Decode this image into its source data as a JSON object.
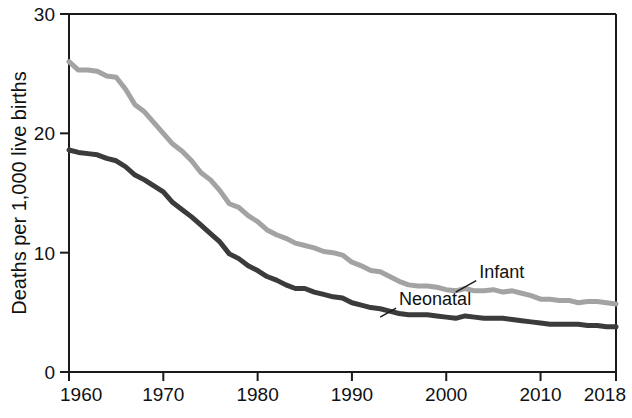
{
  "chart_data": {
    "type": "line",
    "title": "",
    "xlabel": "",
    "ylabel": "Deaths per 1,000 live births",
    "xlim": [
      1960,
      2018
    ],
    "ylim": [
      0,
      30
    ],
    "grid": false,
    "legend_position": "inline-annotations",
    "x_tick_labels": [
      "1960",
      "1970",
      "1980",
      "1990",
      "2000",
      "2010",
      "2018"
    ],
    "x_ticks": [
      1960,
      1970,
      1980,
      1990,
      2000,
      2010,
      2018
    ],
    "y_tick_labels": [
      "0",
      "10",
      "20",
      "30"
    ],
    "y_ticks": [
      0,
      10,
      20,
      30
    ],
    "x": [
      1960,
      1961,
      1962,
      1963,
      1964,
      1965,
      1966,
      1967,
      1968,
      1969,
      1970,
      1971,
      1972,
      1973,
      1974,
      1975,
      1976,
      1977,
      1978,
      1979,
      1980,
      1981,
      1982,
      1983,
      1984,
      1985,
      1986,
      1987,
      1988,
      1989,
      1990,
      1991,
      1992,
      1993,
      1994,
      1995,
      1996,
      1997,
      1998,
      1999,
      2000,
      2001,
      2002,
      2003,
      2004,
      2005,
      2006,
      2007,
      2008,
      2009,
      2010,
      2011,
      2012,
      2013,
      2014,
      2015,
      2016,
      2017,
      2018
    ],
    "series": [
      {
        "name": "Infant",
        "color": "#a3a3a3",
        "label": "Infant",
        "label_x": 2003.5,
        "label_y": 7.9,
        "leader_to_x": 2001.0,
        "leader_to_y": 6.7,
        "values": [
          26.0,
          25.3,
          25.3,
          25.2,
          24.8,
          24.7,
          23.7,
          22.4,
          21.8,
          20.9,
          20.0,
          19.1,
          18.5,
          17.7,
          16.7,
          16.1,
          15.2,
          14.1,
          13.8,
          13.1,
          12.6,
          11.9,
          11.5,
          11.2,
          10.8,
          10.6,
          10.4,
          10.1,
          10.0,
          9.8,
          9.2,
          8.9,
          8.5,
          8.4,
          8.0,
          7.6,
          7.3,
          7.2,
          7.2,
          7.1,
          6.9,
          6.8,
          7.0,
          6.8,
          6.8,
          6.9,
          6.7,
          6.8,
          6.6,
          6.4,
          6.1,
          6.1,
          6.0,
          6.0,
          5.8,
          5.9,
          5.9,
          5.8,
          5.7
        ],
        "label_note": "Infant deaths (under 1 year) per 1,000 live births"
      },
      {
        "name": "Neonatal",
        "color": "#3b3b3b",
        "label": "Neonatal",
        "label_x": 1995.0,
        "label_y": 5.6,
        "leader_to_x": 1993.0,
        "leader_to_y": 4.6,
        "values": [
          18.6,
          18.4,
          18.3,
          18.2,
          17.9,
          17.7,
          17.2,
          16.5,
          16.1,
          15.6,
          15.1,
          14.2,
          13.6,
          13.0,
          12.3,
          11.6,
          10.9,
          9.9,
          9.5,
          8.9,
          8.5,
          8.0,
          7.7,
          7.3,
          7.0,
          7.0,
          6.7,
          6.5,
          6.3,
          6.2,
          5.8,
          5.6,
          5.4,
          5.3,
          5.1,
          4.9,
          4.8,
          4.8,
          4.8,
          4.7,
          4.6,
          4.5,
          4.7,
          4.6,
          4.5,
          4.5,
          4.5,
          4.4,
          4.3,
          4.2,
          4.1,
          4.0,
          4.0,
          4.0,
          4.0,
          3.9,
          3.9,
          3.8,
          3.8
        ],
        "label_note": "Neonatal deaths (under 28 days) per 1,000 live births"
      }
    ]
  },
  "axis": {
    "y_title": "Deaths per 1,000 live births"
  }
}
